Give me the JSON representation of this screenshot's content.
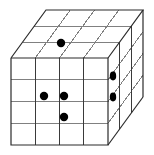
{
  "figure": {
    "type": "isometric-grid-diagram",
    "background_color": "#ffffff",
    "dimensions": {
      "columns": 4,
      "rows": 4,
      "depth": 3
    },
    "geometry": {
      "front_face": {
        "left": 11,
        "top": 58,
        "right": 108,
        "bottom": 145,
        "cell_width": 24.25,
        "cell_height": 21.75
      },
      "depth_offset": {
        "dx": 35,
        "dy": -48
      }
    },
    "colors": {
      "outline": "#2b2b2b",
      "grid_light": "#808080",
      "grid_dark": "#3a3a3a",
      "dot": "#000000",
      "face": "#ffffff"
    }
  },
  "faces": {
    "front": {
      "label": "front-face",
      "columns": 4,
      "rows": 4
    },
    "top": {
      "label": "top-face",
      "columns": 4,
      "depth": 3
    },
    "right": {
      "label": "right-face",
      "rows": 4,
      "depth": 3
    }
  },
  "markers": [
    {
      "name": "dot-top-face-1",
      "face": "top",
      "cx": 61,
      "cy": 43,
      "r": 4.2,
      "cell": "col 3, depth 2"
    },
    {
      "name": "dot-front-face-1",
      "face": "front",
      "cx": 44,
      "cy": 96,
      "r": 4.2,
      "cell": "col 2, row 2"
    },
    {
      "name": "dot-front-face-2",
      "face": "front",
      "cx": 64,
      "cy": 96,
      "r": 4.2,
      "cell": "col 3, row 2"
    },
    {
      "name": "dot-front-face-3",
      "face": "front",
      "cx": 64,
      "cy": 117,
      "r": 4.2,
      "cell": "col 3, row 3"
    },
    {
      "name": "dot-right-face-1",
      "face": "right",
      "cx": 113,
      "cy": 76,
      "r": 4.0,
      "cell": "depth 1, row 1"
    },
    {
      "name": "dot-right-face-2",
      "face": "right",
      "cx": 113,
      "cy": 97,
      "r": 4.0,
      "cell": "depth 1, row 2"
    }
  ],
  "counts": {
    "total_marked_cubes": 6,
    "top_face_dots": 1,
    "front_face_dots": 3,
    "right_face_dots": 2
  }
}
